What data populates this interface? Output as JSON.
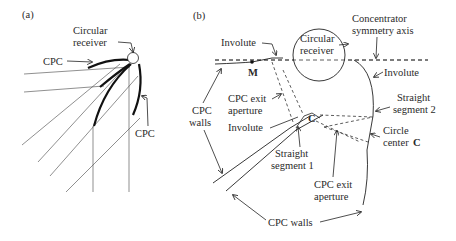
{
  "panel_a": {
    "tag": "(a)",
    "labels": {
      "receiver_line1": "Circular",
      "receiver_line2": "receiver",
      "cpc_left": "CPC",
      "cpc_right": "CPC"
    }
  },
  "panel_b": {
    "tag": "(b)",
    "labels": {
      "involute_top": "Involute",
      "point_m": "M",
      "receiver_line1": "Circular",
      "receiver_line2": "receiver",
      "axis_line1": "Concentrator",
      "axis_line2": "symmetry axis",
      "involute_right": "Involute",
      "straight2_line1": "Straight",
      "straight2_line2": "segment 2",
      "circle_center_line1": "Circle",
      "circle_center_line2": "center",
      "circle_center_letter": "C",
      "point_c": "C",
      "cpc_walls_left_line1": "CPC",
      "cpc_walls_left_line2": "walls",
      "exit_aperture_top_line1": "CPC exit",
      "exit_aperture_top_line2": "aperture",
      "involute_mid": "Involute",
      "straight1_line1": "Straight",
      "straight1_line2": "segment 1",
      "exit_aperture_bottom_line1": "CPC exit",
      "exit_aperture_bottom_line2": "aperture",
      "cpc_walls_bottom": "CPC walls"
    }
  }
}
